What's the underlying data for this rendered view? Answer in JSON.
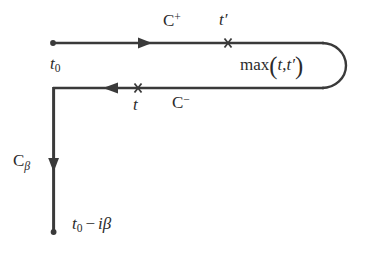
{
  "figure": {
    "name": "keldysh-contour-diagram",
    "background_color": "#ffffff",
    "line_color": "#3a3a3a",
    "text_color": "#2b2b2b",
    "width": 366,
    "height": 259
  },
  "labels": {
    "c_plus": {
      "base": "C",
      "sup": "+"
    },
    "t_prime": {
      "base": "t",
      "prime": "′"
    },
    "t_zero": {
      "base": "t",
      "sub": "0"
    },
    "max_expr": {
      "fn": "max",
      "open": "(",
      "arg1": "t",
      "comma": ",",
      "arg2": "t",
      "prime": "′",
      "close": ")"
    },
    "t_lower": {
      "base": "t"
    },
    "c_minus": {
      "base": "C",
      "sup": "−"
    },
    "c_beta": {
      "base": "C",
      "sub": "β"
    },
    "t0_minus_ibeta": {
      "base": "t",
      "sub": "0",
      "op": "−",
      "i": "i",
      "beta": "β"
    }
  },
  "geometry": {
    "upper_branch": {
      "y": 43,
      "x_start": 53,
      "x_end": 322,
      "direction": "right"
    },
    "lower_branch": {
      "y": 88,
      "x_start": 322,
      "x_end": 53,
      "direction": "left"
    },
    "vertical_branch": {
      "x": 53,
      "y_start": 88,
      "y_end": 232,
      "direction": "down"
    },
    "round_cap": {
      "cx": 322,
      "cy": 65.5,
      "rx": 24,
      "ry": 22.5
    },
    "markers": {
      "start_dot": {
        "x": 53,
        "y": 43
      },
      "end_dot": {
        "x": 53,
        "y": 232
      },
      "cross_t_prime": {
        "x": 228,
        "y": 43
      },
      "cross_t": {
        "x": 138,
        "y": 88
      }
    },
    "arrows": {
      "upper_arrow": {
        "x": 150,
        "y": 43,
        "direction": "right"
      },
      "lower_arrow": {
        "x": 107,
        "y": 88,
        "direction": "left"
      },
      "vertical_arrow": {
        "x": 53,
        "y": 168,
        "direction": "down"
      }
    }
  },
  "colors": {
    "line": "#3a3a3a",
    "text": "#2b2b2b",
    "background": "#ffffff"
  }
}
